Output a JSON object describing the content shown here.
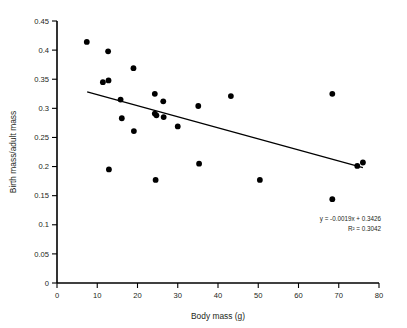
{
  "chart_data": {
    "type": "scatter",
    "title": "",
    "xlabel": "Body mass (g)",
    "ylabel": "Birth mass/adult mass",
    "xlim": [
      0,
      80
    ],
    "ylim": [
      0,
      0.45
    ],
    "grid": false,
    "legend": null,
    "xticks": [
      "0",
      "10",
      "20",
      "30",
      "40",
      "50",
      "60",
      "70",
      "80"
    ],
    "xtick_values": [
      0,
      10,
      20,
      30,
      40,
      50,
      60,
      70,
      80
    ],
    "yticks": [
      "0",
      "0.05",
      "0.1",
      "0.15",
      "0.2",
      "0.25",
      "0.3",
      "0.35",
      "0.4",
      "0.45"
    ],
    "ytick_values": [
      0,
      0.05,
      0.1,
      0.15,
      0.2,
      0.25,
      0.3,
      0.35,
      0.4,
      0.45
    ],
    "points": [
      {
        "x": 7.4,
        "y": 0.414
      },
      {
        "x": 12.7,
        "y": 0.398
      },
      {
        "x": 11.4,
        "y": 0.345
      },
      {
        "x": 12.8,
        "y": 0.348
      },
      {
        "x": 12.9,
        "y": 0.195
      },
      {
        "x": 15.8,
        "y": 0.315
      },
      {
        "x": 16.1,
        "y": 0.283
      },
      {
        "x": 19.0,
        "y": 0.369
      },
      {
        "x": 19.1,
        "y": 0.261
      },
      {
        "x": 24.3,
        "y": 0.325
      },
      {
        "x": 24.3,
        "y": 0.291
      },
      {
        "x": 24.7,
        "y": 0.288
      },
      {
        "x": 24.5,
        "y": 0.177
      },
      {
        "x": 26.4,
        "y": 0.312
      },
      {
        "x": 26.5,
        "y": 0.285
      },
      {
        "x": 30.0,
        "y": 0.269
      },
      {
        "x": 35.1,
        "y": 0.304
      },
      {
        "x": 35.3,
        "y": 0.205
      },
      {
        "x": 43.2,
        "y": 0.321
      },
      {
        "x": 50.4,
        "y": 0.177
      },
      {
        "x": 68.4,
        "y": 0.325
      },
      {
        "x": 68.4,
        "y": 0.144
      },
      {
        "x": 74.6,
        "y": 0.201
      },
      {
        "x": 76.0,
        "y": 0.207
      }
    ],
    "trendline": {
      "slope": -0.0019,
      "intercept": 0.3426,
      "x_start": 7.5,
      "x_end": 76.0,
      "equation_label": "y = -0.0019x + 0.3426",
      "r2_label": "R² = 0.3042",
      "r2_value": 0.3042
    },
    "colors": {
      "point": "#000000",
      "line": "#000000",
      "axis": "#000000",
      "text": "#231f20",
      "background": "#ffffff"
    }
  }
}
